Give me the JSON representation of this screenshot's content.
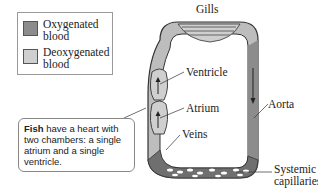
{
  "legend": {
    "items": [
      {
        "label_line1": "Oxygenated",
        "label_line2": "blood",
        "color": "#8c8c8c"
      },
      {
        "label_line1": "Deoxygenated",
        "label_line2": "blood",
        "color": "#cfcfcf"
      }
    ]
  },
  "callout": {
    "bold": "Fish",
    "text": " have a heart with two chambers: a single atrium and a single ventricle."
  },
  "labels": {
    "gills": "Gills",
    "ventricle": "Ventricle",
    "atrium": "Atrium",
    "veins": "Veins",
    "aorta": "Aorta",
    "systemic_line1": "Systemic",
    "systemic_line2": "capillaries"
  },
  "colors": {
    "oxygenated": "#8c8c8c",
    "deoxygenated": "#cfcfcf",
    "outline": "#333333"
  }
}
